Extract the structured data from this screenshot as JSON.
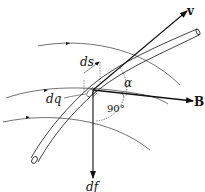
{
  "diagram": {
    "labels": {
      "velocity": "v",
      "magnetic_field": "B",
      "force": "df",
      "length_element": "ds",
      "charge_element": "dq",
      "angle_alpha": "α",
      "right_angle": "90°"
    },
    "colors": {
      "ink": "#111111",
      "background": "#ffffff"
    }
  }
}
